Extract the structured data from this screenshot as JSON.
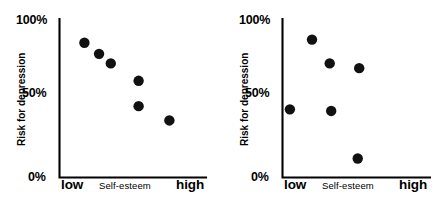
{
  "figure": {
    "background_color": "#ffffff",
    "ink_color": "#000000",
    "panel_count": 2
  },
  "axes": {
    "y_title": "Risk for depression",
    "x_title": "Self-esteem",
    "y_ticks": [
      "100%",
      "50%",
      "0%"
    ],
    "x_low_label": "low",
    "x_high_label": "high"
  },
  "chart_data": [
    {
      "type": "scatter",
      "title": "",
      "panel": "left",
      "relationship": "negative correlation",
      "xlabel": "Self-esteem",
      "ylabel": "Risk for depression",
      "xlim": [
        0,
        100
      ],
      "ylim": [
        0,
        100
      ],
      "x_tick_labels": [
        "low",
        "high"
      ],
      "y_tick_values": [
        0,
        50,
        100
      ],
      "y_tick_labels": [
        "0%",
        "50%",
        "100%"
      ],
      "grid": false,
      "legend": "none",
      "points": [
        {
          "x": 17,
          "y": 85
        },
        {
          "x": 27,
          "y": 78
        },
        {
          "x": 35,
          "y": 72
        },
        {
          "x": 54,
          "y": 61
        },
        {
          "x": 54,
          "y": 45
        },
        {
          "x": 75,
          "y": 36
        }
      ]
    },
    {
      "type": "scatter",
      "title": "",
      "panel": "right",
      "relationship": "no correlation",
      "xlabel": "Self-esteem",
      "ylabel": "Risk for depression",
      "xlim": [
        0,
        100
      ],
      "ylim": [
        0,
        100
      ],
      "x_tick_labels": [
        "low",
        "high"
      ],
      "y_tick_values": [
        0,
        50,
        100
      ],
      "y_tick_labels": [
        "0%",
        "50%",
        "100%"
      ],
      "grid": false,
      "legend": "none",
      "points": [
        {
          "x": 5,
          "y": 43
        },
        {
          "x": 20,
          "y": 87
        },
        {
          "x": 32,
          "y": 72
        },
        {
          "x": 33,
          "y": 42
        },
        {
          "x": 52,
          "y": 69
        },
        {
          "x": 51,
          "y": 12
        }
      ]
    }
  ]
}
